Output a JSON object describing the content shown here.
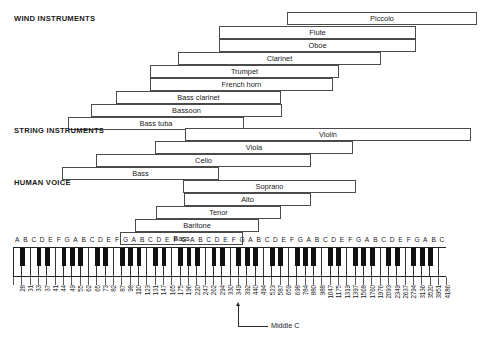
{
  "chart_data": {
    "type": "bar",
    "xlabel": "Frequency (Hz) / piano key",
    "ylabel": "",
    "sections": [
      {
        "id": "wind",
        "label": "WIND INSTRUMENTS",
        "items": [
          {
            "name": "Piccolo",
            "x": 287,
            "w": 190,
            "y": 12
          },
          {
            "name": "Flute",
            "x": 219,
            "w": 197,
            "y": 26
          },
          {
            "name": "Oboe",
            "x": 219,
            "w": 197,
            "y": 39
          },
          {
            "name": "Clarinet",
            "x": 178,
            "w": 203,
            "y": 52
          },
          {
            "name": "Trumpet",
            "x": 150,
            "w": 189,
            "y": 65
          },
          {
            "name": "French horn",
            "x": 150,
            "w": 183,
            "y": 78
          },
          {
            "name": "Bass clarinet",
            "x": 116,
            "w": 165,
            "y": 91
          },
          {
            "name": "Bassoon",
            "x": 91,
            "w": 191,
            "y": 104
          },
          {
            "name": "Bass tuba",
            "x": 68,
            "w": 176,
            "y": 117
          }
        ]
      },
      {
        "id": "string",
        "label": "STRING INSTRUMENTS",
        "items": [
          {
            "name": "Violin",
            "x": 185,
            "w": 286,
            "y": 128
          },
          {
            "name": "Viola",
            "x": 155,
            "w": 198,
            "y": 141
          },
          {
            "name": "Cello",
            "x": 96,
            "w": 215,
            "y": 154
          },
          {
            "name": "Bass",
            "x": 62,
            "w": 157,
            "y": 167
          }
        ]
      },
      {
        "id": "voice",
        "label": "HUMAN VOICE",
        "items": [
          {
            "name": "Soprano",
            "x": 183,
            "w": 173,
            "y": 180
          },
          {
            "name": "Alto",
            "x": 184,
            "w": 127,
            "y": 193
          },
          {
            "name": "Tenor",
            "x": 156,
            "w": 125,
            "y": 206
          },
          {
            "name": "Baritone",
            "x": 135,
            "w": 124,
            "y": 219
          },
          {
            "name": "Bass",
            "x": 120,
            "w": 123,
            "y": 232
          }
        ]
      }
    ],
    "section_label_positions": [
      {
        "id": "wind",
        "x": 14,
        "y": 14
      },
      {
        "id": "string",
        "x": 14,
        "y": 126
      },
      {
        "id": "voice",
        "x": 14,
        "y": 178
      }
    ],
    "keyboard": {
      "start_note": "A",
      "end_note": "C",
      "white_key_count": 52,
      "white_key_width": 8.33,
      "note_letters": [
        "A",
        "B",
        "C",
        "D",
        "E",
        "F",
        "G",
        "A",
        "B",
        "C",
        "D",
        "E",
        "F",
        "G",
        "A",
        "B",
        "C",
        "D",
        "E",
        "F",
        "G",
        "A",
        "B",
        "C",
        "D",
        "E",
        "F",
        "G",
        "A",
        "B",
        "C",
        "D",
        "E",
        "F",
        "G",
        "A",
        "B",
        "C",
        "D",
        "E",
        "F",
        "G",
        "A",
        "B",
        "C",
        "D",
        "E",
        "F",
        "G",
        "A",
        "B",
        "C"
      ],
      "frequencies": [
        28,
        31,
        33,
        37,
        41,
        44,
        49,
        55,
        62,
        65,
        73,
        82,
        87,
        98,
        110,
        123,
        131,
        147,
        165,
        175,
        196,
        220,
        247,
        262,
        294,
        330,
        349,
        392,
        440,
        494,
        523,
        587,
        659,
        698,
        784,
        880,
        988,
        1047,
        1175,
        1319,
        1397,
        1568,
        1760,
        1976,
        2093,
        2349,
        2637,
        2794,
        3136,
        3520,
        3951,
        4186
      ],
      "black_key_pattern_after_white_index": [
        0,
        2,
        3,
        5,
        6
      ],
      "middle_c_white_index": 23,
      "middle_c_frequency": 262
    },
    "annotations": [
      {
        "name": "middle-c-callout",
        "label": "Middle C",
        "x": 236,
        "y": 302
      }
    ],
    "colors": {
      "bar_border": "#4a4a4a",
      "text": "#1a1a1a",
      "white_key": "#ffffff",
      "black_key": "#111111",
      "background": "#ffffff"
    }
  }
}
